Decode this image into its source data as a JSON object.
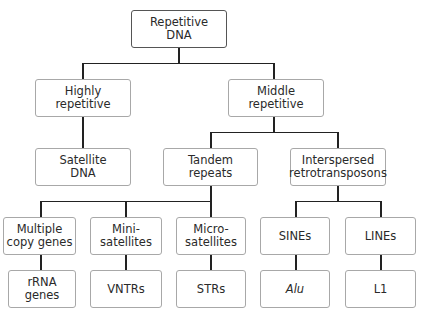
{
  "diagram": {
    "type": "tree",
    "root": {
      "id": "repetitive-dna",
      "label": "Repetitive\nDNA"
    },
    "nodes": [
      {
        "id": "repetitive-dna",
        "label": "Repetitive\nDNA",
        "parent": null
      },
      {
        "id": "highly-repetitive",
        "label": "Highly\nrepetitive",
        "parent": "repetitive-dna"
      },
      {
        "id": "middle-repetitive",
        "label": "Middle\nrepetitive",
        "parent": "repetitive-dna"
      },
      {
        "id": "satellite-dna",
        "label": "Satellite\nDNA",
        "parent": "highly-repetitive"
      },
      {
        "id": "tandem-repeats",
        "label": "Tandem\nrepeats",
        "parent": "middle-repetitive"
      },
      {
        "id": "interspersed-retrotransposons",
        "label": "Interspersed\nretrotransposons",
        "parent": "middle-repetitive"
      },
      {
        "id": "multiple-copy-genes",
        "label": "Multiple\ncopy genes",
        "parent": "tandem-repeats"
      },
      {
        "id": "mini-satellites",
        "label": "Mini-\nsatellites",
        "parent": "tandem-repeats"
      },
      {
        "id": "micro-satellites",
        "label": "Micro-\nsatellites",
        "parent": "tandem-repeats"
      },
      {
        "id": "sines",
        "label": "SINEs",
        "parent": "interspersed-retrotransposons"
      },
      {
        "id": "lines",
        "label": "LINEs",
        "parent": "interspersed-retrotransposons"
      },
      {
        "id": "rrna-genes",
        "label": "rRNA\ngenes",
        "parent": "multiple-copy-genes"
      },
      {
        "id": "vntrs",
        "label": "VNTRs",
        "parent": "mini-satellites"
      },
      {
        "id": "strs",
        "label": "STRs",
        "parent": "micro-satellites"
      },
      {
        "id": "alu",
        "label": "Alu",
        "parent": "sines",
        "italic": true
      },
      {
        "id": "l1",
        "label": "L1",
        "parent": "lines"
      }
    ]
  },
  "labels": {
    "root": "Repetitive\nDNA",
    "highly": "Highly\nrepetitive",
    "middle": "Middle\nrepetitive",
    "satellite": "Satellite\nDNA",
    "tandem": "Tandem\nrepeats",
    "interspersed": "Interspersed\nretrotransposons",
    "multiple": "Multiple\ncopy genes",
    "mini": "Mini-\nsatellites",
    "micro": "Micro-\nsatellites",
    "sines": "SINEs",
    "lines": "LINEs",
    "rrna": "rRNA\ngenes",
    "vntrs": "VNTRs",
    "strs": "STRs",
    "alu": "Alu",
    "l1": "L1"
  },
  "colors": {
    "connector": "#222222",
    "box_border": "#a8a8a8",
    "root_border": "#555555",
    "text": "#2a2a2a",
    "background": "#ffffff"
  }
}
